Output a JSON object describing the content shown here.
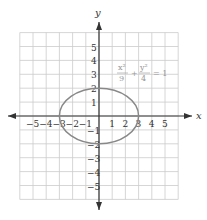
{
  "chart_data": {
    "type": "line",
    "title": "",
    "xlabel": "x",
    "ylabel": "y",
    "xlim": [
      -6,
      6
    ],
    "ylim": [
      -6,
      6
    ],
    "grid": true,
    "x_ticks": [
      "-5",
      "-4",
      "-3",
      "-2",
      "-1",
      "1",
      "2",
      "3",
      "4",
      "5"
    ],
    "y_ticks": [
      "5",
      "4",
      "3",
      "2",
      "1",
      "-1",
      "-2",
      "-3",
      "-4",
      "-5"
    ],
    "annotation": {
      "equation": "x²/9 + y²/4 = 1",
      "num1": "x²",
      "den1": "9",
      "plus": "+",
      "num2": "y²",
      "den2": "4",
      "eq": "= 1"
    },
    "series": [
      {
        "name": "ellipse x²/9 + y²/4 = 1",
        "shape": "ellipse",
        "center": [
          0,
          0
        ],
        "a": 3,
        "b": 2,
        "color": "#888888"
      }
    ]
  }
}
